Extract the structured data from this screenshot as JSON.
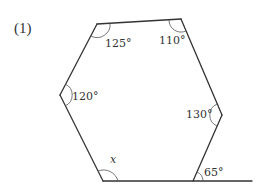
{
  "problem_number": "(1)",
  "figure": {
    "shape": "hexagon",
    "unknown_variable": "x",
    "angles": {
      "top_left": "125°",
      "top_right": "110°",
      "left": "120°",
      "right": "130°",
      "bottom_left": "x",
      "bottom_right_exterior": "65°"
    }
  }
}
